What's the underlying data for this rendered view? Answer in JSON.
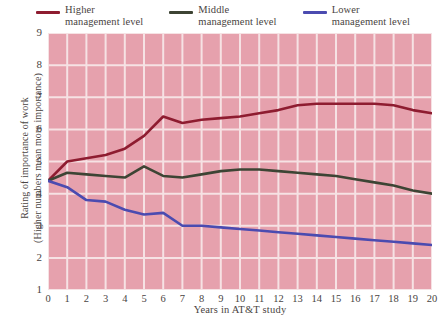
{
  "legend": {
    "items": [
      {
        "name": "higher-management-level",
        "line1": "Higher",
        "line2": "management level",
        "color": "#8e1c30"
      },
      {
        "name": "middle-management-level",
        "line1": "Middle",
        "line2": "management level",
        "color": "#3d4434"
      },
      {
        "name": "lower-management-level",
        "line1": "Lower",
        "line2": "management level",
        "color": "#4b4bb0"
      }
    ]
  },
  "axes": {
    "y_title_line1": "Rating of importance of work",
    "y_title_line2": "(Higher numbers mean more importance)",
    "x_title": "Years in AT&T study",
    "y_ticks": [
      "9",
      "8",
      "7",
      "6",
      "5",
      "4",
      "3",
      "2",
      "1"
    ],
    "x_ticks": [
      "0",
      "1",
      "2",
      "3",
      "4",
      "5",
      "6",
      "7",
      "8",
      "9",
      "10",
      "11",
      "12",
      "13",
      "14",
      "15",
      "16",
      "17",
      "18",
      "19",
      "20"
    ]
  },
  "colors": {
    "plot_background": "#e6a1ad",
    "gridline": "#f6e2e4",
    "page_background": "#ffffff",
    "text": "#4a4442"
  },
  "chart_data": {
    "type": "line",
    "title": "",
    "xlabel": "Years in AT&T study",
    "ylabel": "Rating of importance of work (Higher numbers mean more importance)",
    "xlim": [
      0,
      20
    ],
    "ylim": [
      1,
      9
    ],
    "grid": true,
    "legend_position": "top",
    "x": [
      0,
      1,
      2,
      3,
      4,
      5,
      6,
      7,
      8,
      9,
      10,
      11,
      12,
      13,
      14,
      15,
      16,
      17,
      18,
      19,
      20
    ],
    "series": [
      {
        "name": "Higher management level",
        "color": "#8e1c30",
        "values": [
          4.4,
          5.0,
          5.1,
          5.2,
          5.4,
          5.8,
          6.4,
          6.2,
          6.3,
          6.35,
          6.4,
          6.5,
          6.6,
          6.75,
          6.8,
          6.8,
          6.8,
          6.8,
          6.75,
          6.6,
          6.5
        ]
      },
      {
        "name": "Middle management level",
        "color": "#3d4434",
        "values": [
          4.4,
          4.65,
          4.6,
          4.55,
          4.5,
          4.85,
          4.55,
          4.5,
          4.6,
          4.7,
          4.75,
          4.75,
          4.7,
          4.65,
          4.6,
          4.55,
          4.45,
          4.35,
          4.25,
          4.1,
          4.0
        ]
      },
      {
        "name": "Lower management level",
        "color": "#4b4bb0",
        "values": [
          4.4,
          4.2,
          3.8,
          3.75,
          3.5,
          3.35,
          3.4,
          3.0,
          3.0,
          2.95,
          2.9,
          2.85,
          2.8,
          2.75,
          2.7,
          2.65,
          2.6,
          2.55,
          2.5,
          2.45,
          2.4
        ]
      }
    ]
  }
}
